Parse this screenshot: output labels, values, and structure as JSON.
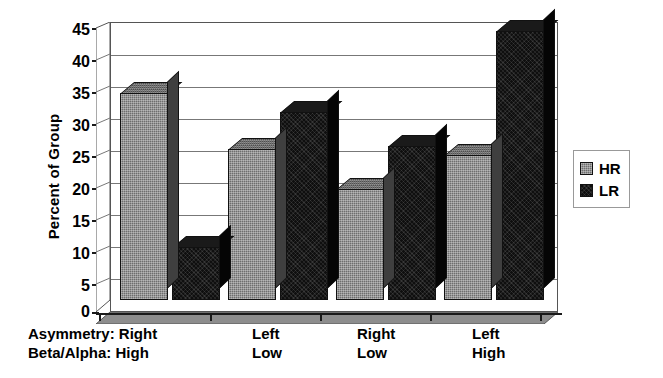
{
  "chart_data": {
    "type": "bar",
    "title": "",
    "subtitle": "",
    "xlabel": "",
    "ylabel": "Percent of Group",
    "ylim": [
      0,
      45
    ],
    "ytick_step": 5,
    "yticks": [
      "0",
      "5",
      "10",
      "15",
      "20",
      "25",
      "30",
      "35",
      "40",
      "45"
    ],
    "grid": true,
    "three_d": true,
    "legend_position": "right",
    "categories": [
      {
        "line1": "Asymmetry: Right",
        "line2": "Beta/Alpha: High"
      },
      {
        "line1": "Left",
        "line2": "Low"
      },
      {
        "line1": "Right",
        "line2": "Low"
      },
      {
        "line1": "Left",
        "line2": "High"
      }
    ],
    "category_keys": [
      "Right / High",
      "Left / Low",
      "Right / Low",
      "Left / High"
    ],
    "series": [
      {
        "name": "HR",
        "color": "#6e6e6e",
        "values": [
          33.5,
          24.5,
          18.0,
          23.5
        ]
      },
      {
        "name": "LR",
        "color": "#0f0f0f",
        "values": [
          8.5,
          30.5,
          25.0,
          43.5
        ]
      }
    ],
    "legend": [
      {
        "label": "HR",
        "color": "#6e6e6e"
      },
      {
        "label": "LR",
        "color": "#0f0f0f"
      }
    ]
  }
}
